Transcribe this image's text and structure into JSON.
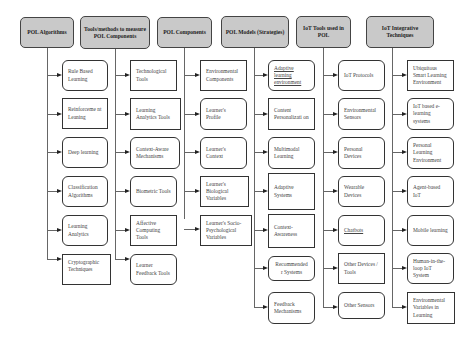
{
  "diagram": {
    "columns": [
      {
        "header": "POL Algorithms",
        "items": [
          "Rule Based Learning",
          "Reinforceme nt Leaning",
          "Deep learning",
          "Classification Algorithms",
          "Learning Analytics",
          "Cryptographic Techniques"
        ]
      },
      {
        "header": "Tools/methods to measure POL Components",
        "items": [
          "Technological Tools",
          "Learning Analytics Tools",
          "Context-Aware Mechanisms",
          "Biometric Tools",
          "Affective Computing Tools",
          "Learner Feedback Tools"
        ]
      },
      {
        "header": "POL Components",
        "items": [
          "Environmental Components",
          "Learner's Profile",
          "Learner's Context",
          "Learner's Biological Variables",
          "Learner's Socio-Psychological Variables"
        ]
      },
      {
        "header": "POL Models (Strategies)",
        "items": [
          "Adaptive learning environment",
          "Content Personalizati on",
          "Multimodal Learning",
          "Adaptive Systems",
          "Context-Awareness",
          "Recommended r Systems",
          "Feedback Mechanisms"
        ]
      },
      {
        "header": "IoT Tools used in POL",
        "items": [
          "IoT Protocols",
          "Environmental Sensors",
          "Personal Devices",
          "Wearable Devices",
          "Chatbots",
          "Other Devices / Tools",
          "Other Sensors"
        ]
      },
      {
        "header": "IoT Integrative Techniques",
        "items": [
          "Ubiquitous Smart Learning Environment",
          "IoT based e-learning systems",
          "Personal Learning Environment",
          "Agent-based IoT",
          "Mobile learning",
          "Human-in-the-loop IoT System",
          "Environmental Variables in Learning"
        ]
      }
    ]
  }
}
